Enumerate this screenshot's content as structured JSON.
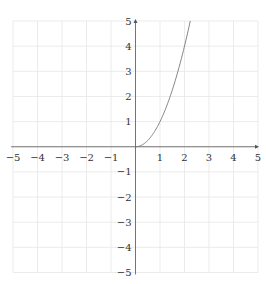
{
  "chart_data": {
    "type": "line",
    "title": "",
    "xlabel": "",
    "ylabel": "",
    "xlim": [
      -5,
      5
    ],
    "ylim": [
      -5,
      5
    ],
    "grid": true,
    "legend": null,
    "x_ticks": [
      "−5",
      "−4",
      "−3",
      "−2",
      "−1",
      "1",
      "2",
      "3",
      "4",
      "5"
    ],
    "y_ticks": [
      "5",
      "4",
      "3",
      "2",
      "1",
      "−1",
      "−2",
      "−3",
      "−4",
      "−5"
    ],
    "x_tick_values": [
      -5,
      -4,
      -3,
      -2,
      -1,
      1,
      2,
      3,
      4,
      5
    ],
    "y_tick_values": [
      5,
      4,
      3,
      2,
      1,
      -1,
      -2,
      -3,
      -4,
      -5
    ],
    "series": [
      {
        "name": "y = x^2 (x ≥ 0)",
        "x": [
          0,
          0.25,
          0.5,
          0.75,
          1,
          1.25,
          1.5,
          1.75,
          2,
          2.236
        ],
        "y": [
          0,
          0.0625,
          0.25,
          0.5625,
          1,
          1.5625,
          2.25,
          3.0625,
          4,
          5
        ]
      }
    ]
  },
  "colors": {
    "grid": "#e6e6e6",
    "axis": "#555555",
    "curve": "#777777",
    "labels": "#333333"
  }
}
